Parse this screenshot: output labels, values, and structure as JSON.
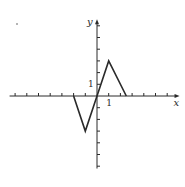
{
  "figure": {
    "type": "piecewise-linear function graph",
    "x_axis_label": "x",
    "y_axis_label": "y",
    "x_unit_label": "1",
    "y_unit_label": "1",
    "stroke_color": "#2a2a2a",
    "background": "#ffffff"
  },
  "axes": {
    "x_ticks": [
      -7,
      -6,
      -5,
      -4,
      -3,
      -2,
      -1,
      1,
      2,
      3,
      4,
      5,
      6
    ],
    "y_ticks": [
      -6,
      -5,
      -4,
      -3,
      -2,
      -1,
      1,
      2,
      3,
      4,
      5,
      6
    ],
    "xlim": [
      -7.3,
      6.8
    ],
    "ylim": [
      -6.2,
      6.3
    ]
  },
  "graph": {
    "vertices": [
      {
        "x": -2,
        "y": 0
      },
      {
        "x": -1,
        "y": -3
      },
      {
        "x": 0,
        "y": 0
      },
      {
        "x": 1,
        "y": 3
      },
      {
        "x": 2.5,
        "y": 0
      }
    ]
  }
}
